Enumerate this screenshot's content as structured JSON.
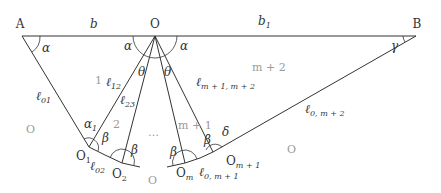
{
  "points": {
    "A": "A",
    "O": "O",
    "B": "B",
    "O1": {
      "base": "O",
      "sub": "1"
    },
    "O2": {
      "base": "O",
      "sub": "2"
    },
    "Om": {
      "base": "O",
      "sub": "m"
    },
    "Om1": {
      "base": "O",
      "sub": "m + 1"
    }
  },
  "segments": {
    "b": "b",
    "b1": {
      "base": "b",
      "sub": "1"
    },
    "l01": {
      "base": "ℓ",
      "sub": "01"
    },
    "l12": {
      "base": "ℓ",
      "sub": "12"
    },
    "l23": {
      "base": "ℓ",
      "sub": "23"
    },
    "lm1m2": {
      "base": "ℓ",
      "sub": "m + 1, m + 2"
    },
    "l02": {
      "base": "ℓ",
      "sub": "02"
    },
    "l0m1": {
      "base": "ℓ",
      "sub": "0, m + 1"
    },
    "l0m2": {
      "base": "ℓ",
      "sub": "0, m + 2"
    }
  },
  "angles": {
    "alpha": "α",
    "alpha1": {
      "base": "α",
      "sub": "1"
    },
    "beta": "β",
    "theta": "θ",
    "gamma": "γ",
    "delta": "δ"
  },
  "regions": {
    "r1": "1",
    "r2": "2",
    "dots": "…",
    "rm1": "m + 1",
    "rm2": "m + 2",
    "outer_left": "O",
    "outer_bottom": "O",
    "outer_right": "O"
  }
}
